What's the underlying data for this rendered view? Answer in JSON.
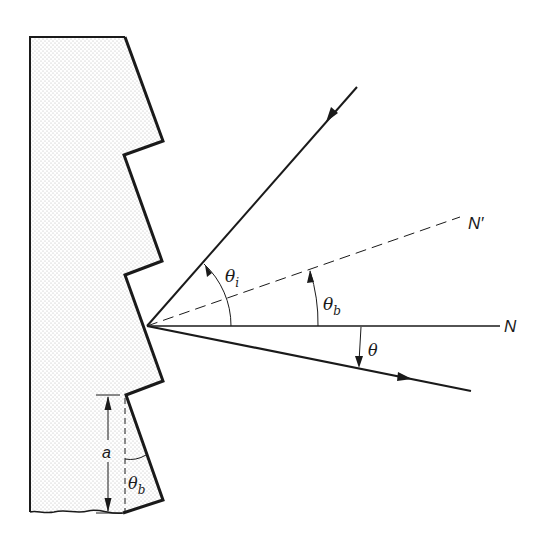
{
  "figure": {
    "type": "blazed-grating-geometry",
    "colors": {
      "line": "#1a1a1a",
      "fill_stipple": "#c8c8c8",
      "background": "#ffffff"
    },
    "labels": {
      "normal_grating": "N",
      "normal_facet": "N′",
      "incident_angle": "θ",
      "incident_angle_sub": "i",
      "blaze_angle": "θ",
      "blaze_angle_sub": "b",
      "diffracted_angle": "θ",
      "groove_spacing": "a",
      "facet_blaze_angle": "θ",
      "facet_blaze_angle_sub": "b"
    },
    "elements": {
      "grating_body": "sawtooth grating cross-section (stippled)",
      "incident_ray": "incident ray with arrow toward grating",
      "facet_normal": "dashed facet normal N′",
      "grating_normal": "grating normal N",
      "diffracted_ray": "diffracted ray with arrow away from grating",
      "spacing_dimension": "double-headed arrow marking groove spacing a"
    }
  }
}
